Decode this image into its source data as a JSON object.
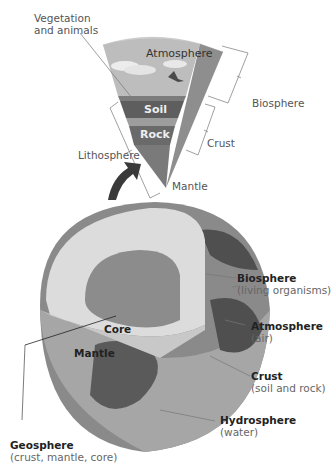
{
  "wedge": {
    "layers": {
      "atmosphere": "Atmosphere",
      "soil": "Soil",
      "rock": "Rock"
    },
    "callouts": {
      "vegetation_line1": "Vegetation",
      "vegetation_line2": "and animals",
      "biosphere": "Biosphere",
      "crust": "Crust",
      "lithosphere": "Lithosphere",
      "mantle": "Mantle"
    }
  },
  "globe": {
    "inner": {
      "core": "Core",
      "mantle": "Mantle"
    },
    "labels": [
      {
        "title": "Biosphere",
        "sub": "(living organisms)"
      },
      {
        "title": "Atmosphere",
        "sub": "(air)"
      },
      {
        "title": "Crust",
        "sub": "(soil and rock)"
      },
      {
        "title": "Hydrosphere",
        "sub": "(water)"
      },
      {
        "title": "Geosphere",
        "sub": "(crust, mantle, core)"
      }
    ]
  },
  "colors": {
    "sky": "#b9b9b9",
    "soil": "#5e5e5e",
    "rock": "#6a6a6a",
    "mantle_wedge": "#7a7a7a",
    "mantle_globe": "#dcdcdc",
    "core": "#8c8c8c",
    "ocean": "#a8a8a8",
    "land": "#5a5a5a",
    "arrow": "#3a3a3a"
  }
}
